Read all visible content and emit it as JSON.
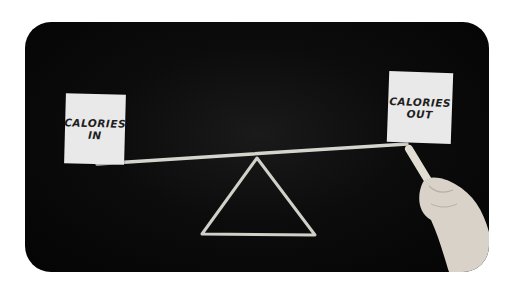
{
  "image": {
    "description": "Chalkboard seesaw illustrating calorie balance, a hand holding chalk on the right",
    "left_note": {
      "line1": "CALORIES",
      "line2": "IN"
    },
    "right_note": {
      "line1": "CALORIES",
      "line2": "OUT"
    },
    "colors": {
      "board": "#050505",
      "chalk": "#e8e8e0",
      "note": "#e9e9e9",
      "background": "#ffffff"
    }
  }
}
